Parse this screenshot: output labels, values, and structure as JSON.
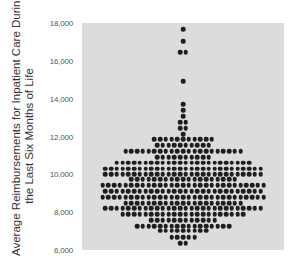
{
  "chart_data": {
    "type": "scatter",
    "subtype": "dot_plot_beeswarm",
    "title": "",
    "xlabel": "",
    "ylabel": "Average Reimbursements for Inpatient Care During the Last Six Months of Life",
    "ylabel_lines": [
      "Average Reimbursements for Inpatient Care During",
      "the Last Six Months of Life"
    ],
    "ylim": [
      6000,
      18000
    ],
    "yticks": [
      6000,
      8000,
      10000,
      12000,
      14000,
      16000,
      18000
    ],
    "ytick_labels": [
      "6,000",
      "8,000",
      "10,000",
      "12,000",
      "14,000",
      "16,000",
      "18,000"
    ],
    "grid": false,
    "legend": null,
    "background_color": "#dcdcdc",
    "dot_color": "#1e1e1e",
    "rows": [
      {
        "value": 17680,
        "count": 1
      },
      {
        "value": 17050,
        "count": 1
      },
      {
        "value": 16460,
        "count": 2
      },
      {
        "value": 14930,
        "count": 1
      },
      {
        "value": 13720,
        "count": 1
      },
      {
        "value": 13400,
        "count": 1
      },
      {
        "value": 13080,
        "count": 1
      },
      {
        "value": 12760,
        "count": 2
      },
      {
        "value": 12440,
        "count": 2
      },
      {
        "value": 12130,
        "count": 1
      },
      {
        "value": 11860,
        "count": 11
      },
      {
        "value": 11540,
        "count": 10
      },
      {
        "value": 11220,
        "count": 21
      },
      {
        "value": 10910,
        "count": 10
      },
      {
        "value": 10620,
        "count": 24
      },
      {
        "value": 10300,
        "count": 28
      },
      {
        "value": 10000,
        "count": 28
      },
      {
        "value": 9730,
        "count": 19
      },
      {
        "value": 9420,
        "count": 29
      },
      {
        "value": 9100,
        "count": 28
      },
      {
        "value": 8790,
        "count": 29
      },
      {
        "value": 8480,
        "count": 21
      },
      {
        "value": 8210,
        "count": 28
      },
      {
        "value": 7900,
        "count": 22
      },
      {
        "value": 7590,
        "count": 12
      },
      {
        "value": 7270,
        "count": 17
      },
      {
        "value": 7010,
        "count": 9
      },
      {
        "value": 6690,
        "count": 5
      },
      {
        "value": 6370,
        "count": 2
      }
    ],
    "total_points": 367
  }
}
